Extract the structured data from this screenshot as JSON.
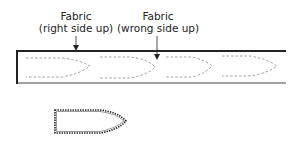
{
  "diagram": {
    "labels": [
      {
        "id": "right-side",
        "line1": "Fabric",
        "line2": "(right side up)"
      },
      {
        "id": "wrong-side",
        "line1": "Fabric",
        "line2": "(wrong side up)"
      }
    ],
    "strip": {
      "pattern_pieces": 4,
      "outline": "dashed"
    },
    "cut_piece": {
      "edge": "pinked"
    }
  }
}
